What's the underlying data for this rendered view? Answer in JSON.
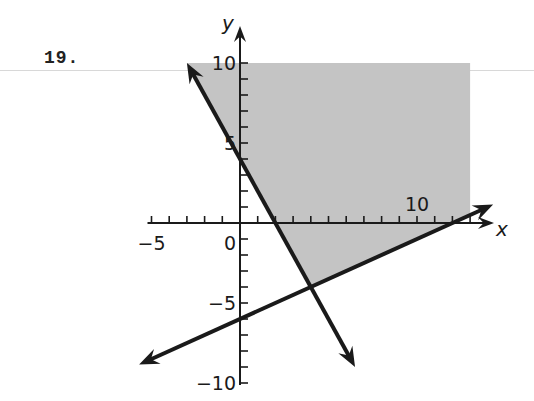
{
  "problem": {
    "number": "19."
  },
  "chart_data": {
    "type": "line",
    "title": "",
    "xlabel": "x",
    "ylabel": "y",
    "xlim": [
      -5,
      14
    ],
    "ylim": [
      -10,
      10
    ],
    "grid": false,
    "x_tick_labels": [
      "-5",
      "0",
      "10"
    ],
    "y_tick_labels": [
      "10",
      "5",
      "-5",
      "-10"
    ],
    "x_tick_step": 1,
    "y_tick_step": 1,
    "series": [
      {
        "name": "line 1",
        "equation": "y = -2x + 4",
        "slope": -2,
        "intercept": 4,
        "x_range": [
          -3,
          6.5
        ],
        "arrows": "both"
      },
      {
        "name": "line 2",
        "equation": "y = 0.5x - 6",
        "slope": 0.5,
        "intercept": -6,
        "x_range": [
          -5.7,
          14.3
        ],
        "arrows": "both"
      }
    ],
    "shaded_region": {
      "description": "y >= -2x + 4 and y >= 0.5x - 6",
      "vertices": [
        [
          -3,
          10
        ],
        [
          13,
          10
        ],
        [
          13,
          0.5
        ],
        [
          4,
          -4
        ]
      ],
      "fill": "#c4c4c4"
    },
    "intersection": [
      4,
      -4
    ]
  },
  "colors": {
    "shade": "#c4c4c4",
    "ink": "#1a1a1a"
  }
}
